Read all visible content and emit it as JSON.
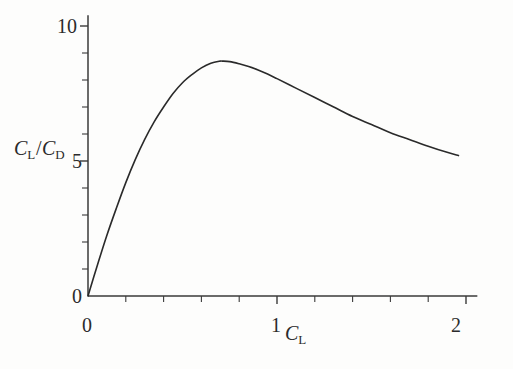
{
  "figure": {
    "background_color": "#fdfdfc",
    "line_color": "#2a2a2a",
    "axis_color": "#3a3a3a"
  },
  "chart_data": {
    "type": "line",
    "title": "",
    "subtitle": "",
    "xlabel": "C_L",
    "ylabel": "C_L/C_D",
    "xlabel_parts": {
      "base": "C",
      "sub": "L"
    },
    "ylabel_parts": {
      "num_base": "C",
      "num_sub": "L",
      "slash": "/",
      "den_base": "C",
      "den_sub": "D"
    },
    "xlim": [
      0,
      2.06
    ],
    "ylim": [
      0,
      10.4
    ],
    "xticks": [
      0,
      1,
      2
    ],
    "xtick_labels": [
      "0",
      "1",
      "2"
    ],
    "yticks": [
      0,
      5,
      10
    ],
    "ytick_labels": [
      "0",
      "5",
      "10"
    ],
    "x_minor_tick_step": 0.2,
    "y_minor_tick_step": 1,
    "grid": false,
    "legend": null,
    "legend_position": "none",
    "tick_direction": "out",
    "annotations": [],
    "series": [
      {
        "name": "lift-to-drag ratio",
        "x": [
          0.0,
          0.05,
          0.1,
          0.15,
          0.2,
          0.25,
          0.3,
          0.35,
          0.4,
          0.45,
          0.5,
          0.55,
          0.6,
          0.65,
          0.7,
          0.71,
          0.75,
          0.8,
          0.85,
          0.9,
          0.95,
          1.0,
          1.1,
          1.2,
          1.3,
          1.4,
          1.5,
          1.6,
          1.7,
          1.8,
          1.9,
          1.96
        ],
        "y": [
          0.0,
          1.15,
          2.25,
          3.25,
          4.2,
          5.05,
          5.8,
          6.45,
          7.0,
          7.5,
          7.9,
          8.2,
          8.45,
          8.62,
          8.7,
          8.7,
          8.68,
          8.6,
          8.5,
          8.37,
          8.22,
          8.05,
          7.7,
          7.35,
          7.0,
          6.65,
          6.35,
          6.05,
          5.8,
          5.55,
          5.32,
          5.2
        ]
      }
    ],
    "peak": {
      "x": 0.71,
      "y": 8.7
    },
    "endpoint": {
      "x": 1.96,
      "y": 5.2
    }
  }
}
